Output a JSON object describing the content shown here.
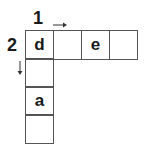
{
  "crossword": {
    "clues": [
      {
        "number": "1",
        "direction": "across"
      },
      {
        "number": "2",
        "direction": "down"
      }
    ],
    "across_cells": [
      "d",
      "",
      "e",
      ""
    ],
    "down_cells": [
      "",
      "a",
      ""
    ]
  },
  "icons": {
    "across": "right-arrow-icon",
    "down": "down-arrow-icon"
  }
}
